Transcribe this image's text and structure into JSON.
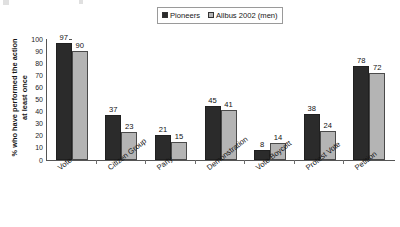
{
  "chart_data": {
    "type": "bar",
    "title": "",
    "subtitle": "",
    "xlabel": "",
    "ylabel": "% who have performed the action at least once",
    "ylabel_line1": "% who have performed the action",
    "ylabel_line2": "at least once",
    "ylim": [
      0,
      100
    ],
    "ytick_step": 10,
    "yticks": [
      "100",
      "90",
      "80",
      "70",
      "60",
      "50",
      "40",
      "30",
      "20",
      "10",
      "0"
    ],
    "grid": false,
    "legend_position": "top-center",
    "categories": [
      "Vote",
      "Citizen Group",
      "Party",
      "Demonstration",
      "Vote Boycott",
      "Protest Vote",
      "Petition"
    ],
    "series": [
      {
        "name": "Pioneers",
        "color": "#2b2b2b",
        "values": [
          97,
          37,
          21,
          45,
          8,
          38,
          78
        ]
      },
      {
        "name": "Allbus 2002 (men)",
        "color": "#b4b4b4",
        "values": [
          90,
          23,
          15,
          41,
          14,
          24,
          72
        ]
      }
    ],
    "data_labels": true
  },
  "legend": {
    "entries": [
      {
        "label": "Pioneers",
        "swatch": "dark-swatch-icon"
      },
      {
        "label": "Allbus 2002 (men)",
        "swatch": "light-swatch-icon"
      }
    ]
  },
  "colors": {
    "series_pioneers": "#2b2b2b",
    "series_allbus": "#b4b4b4",
    "axis": "#555555",
    "background": "#ffffff",
    "text": "#161616"
  }
}
